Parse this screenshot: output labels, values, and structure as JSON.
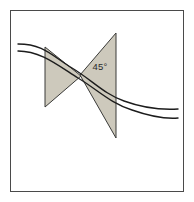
{
  "figure": {
    "background_color": "#ffffff",
    "canvas": {
      "width": 194,
      "height": 202
    }
  },
  "frame": {
    "name": "outer-frame",
    "stroke_color": "#4a4a4a",
    "fill_color": "#ffffff",
    "x": 10,
    "y": 10,
    "width": 174,
    "height": 182,
    "stroke_width": 1
  },
  "shapes": {
    "fill_color": "#cdc9bc",
    "stroke_color": "#3a3a38",
    "stroke_width": 1,
    "left_triangle": {
      "label": "left-triangle",
      "points": "45,47 45,107 81,76",
      "description": "Left shaded triangle, vertical left edge, apex pointing right"
    },
    "right_triangle": {
      "label": "right-triangle",
      "points": "116,33 116,138 80,75",
      "description": "Right shaded triangle, vertical right edge, apex pointing left"
    }
  },
  "curves": {
    "stroke_color": "#1c1c1c",
    "stroke_width": 1.4,
    "upper_wave": {
      "label": "upper-wave-curve",
      "path": "M 18 44 C 44 44, 52 56, 72 68 C 92 80, 104 94, 124 101 C 146 109, 162 110, 178 109"
    },
    "lower_wave": {
      "label": "lower-wave-curve",
      "path": "M 18 51 C 40 51, 56 64, 78 78 C 98 90, 110 103, 132 110 C 152 117, 166 119, 178 118"
    }
  },
  "annotations": {
    "angle": {
      "label": "45°",
      "x": 100,
      "y": 70,
      "color": "#2b2b2b"
    }
  }
}
